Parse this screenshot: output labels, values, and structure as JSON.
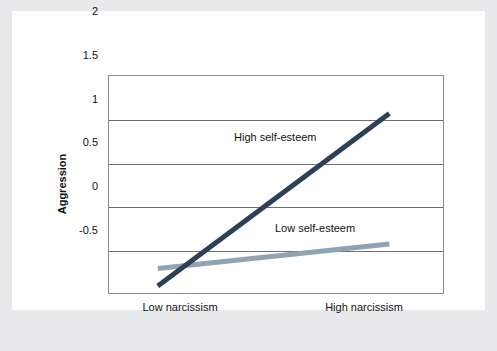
{
  "figure": {
    "background_outer": "#e7e9ea",
    "background_panel": "#ffffff",
    "axis_color": "#6f6f6f"
  },
  "chart_data": {
    "type": "line",
    "title": "",
    "xlabel": "",
    "ylabel": "Aggression",
    "categories": [
      "Low narcissism",
      "High narcissism"
    ],
    "x": [
      0,
      1
    ],
    "xlim": [
      -0.215,
      1.236
    ],
    "ylim": [
      -0.5,
      2
    ],
    "yticks": [
      2,
      1.5,
      1,
      0.5,
      0,
      -0.5
    ],
    "ytick_labels": [
      "2",
      "1.5",
      "1",
      "0.5",
      "0",
      "-0.5"
    ],
    "grid": true,
    "grid_axis": "y",
    "legend": "inline-annotations",
    "series": [
      {
        "name": "High self-esteem",
        "color": "#2e4057",
        "values": [
          -0.41,
          1.56
        ],
        "label_x": 222,
        "label_y": 120
      },
      {
        "name": "Low self-esteem",
        "color": "#8fa3b5",
        "values": [
          -0.21,
          0.07
        ],
        "label_x": 263,
        "label_y": 211
      }
    ]
  },
  "axis": {
    "y_title": "Aggression",
    "ytick_labels": [
      "2",
      "1.5",
      "1",
      "0.5",
      "0",
      "-0.5"
    ],
    "xtick_labels": [
      "Low narcissism",
      "High narcissism"
    ]
  },
  "annotations": {
    "high_self_esteem": "High self-esteem",
    "low_self_esteem": "Low self-esteem"
  }
}
